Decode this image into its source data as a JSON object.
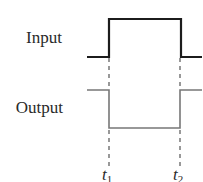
{
  "labels": {
    "input": "Input",
    "output": "Output",
    "t1_base": "t",
    "t1_sub": "1",
    "t2_base": "t",
    "t2_sub": "2"
  },
  "colors": {
    "input_line": "#1c1c1c",
    "output_line": "#777777",
    "dash_line": "#555555",
    "text": "#2a2a2a"
  },
  "signals": {
    "input": {
      "shape": "pulse-high",
      "levels": [
        "low",
        "high",
        "low"
      ],
      "transitions": [
        "t1",
        "t2"
      ]
    },
    "output": {
      "shape": "pulse-low",
      "levels": [
        "high",
        "low",
        "high"
      ],
      "transitions": [
        "t1",
        "t2"
      ]
    }
  }
}
